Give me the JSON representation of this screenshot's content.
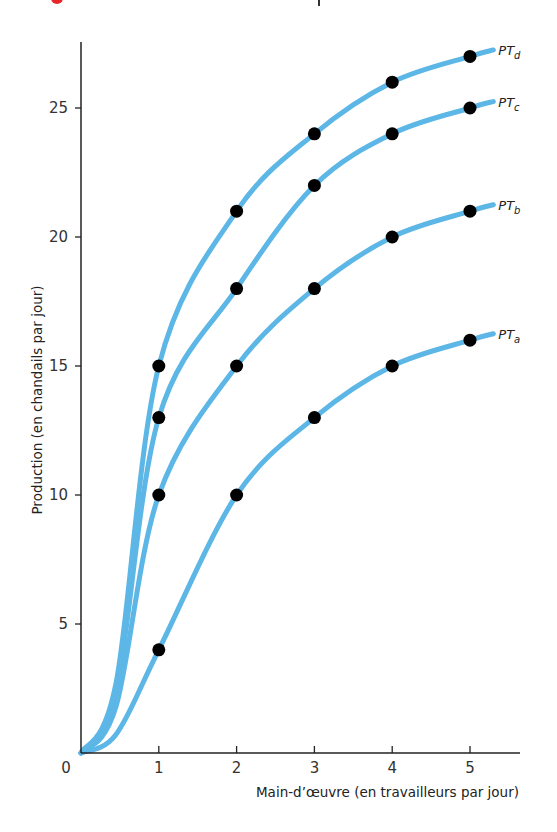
{
  "chart_data": {
    "type": "line",
    "title": "",
    "xlabel": "Main-d’œuvre (en travailleurs par jour)",
    "ylabel": "Production (en chandails par jour)",
    "x": [
      1,
      2,
      3,
      4,
      5
    ],
    "x_ticks": [
      "0",
      "1",
      "2",
      "3",
      "4",
      "5"
    ],
    "y_ticks": [
      "5",
      "10",
      "15",
      "20",
      "25"
    ],
    "xlim": [
      0,
      5.6
    ],
    "ylim": [
      0,
      28
    ],
    "grid": false,
    "legend_position": "inline-right",
    "series": [
      {
        "name": "PTa",
        "label_main": "PT",
        "label_sub": "a",
        "values": [
          4,
          10,
          13,
          15,
          16
        ]
      },
      {
        "name": "PTb",
        "label_main": "PT",
        "label_sub": "b",
        "values": [
          10,
          15,
          18,
          20,
          21
        ]
      },
      {
        "name": "PTc",
        "label_main": "PT",
        "label_sub": "c",
        "values": [
          13,
          18,
          22,
          24,
          25
        ]
      },
      {
        "name": "PTd",
        "label_main": "PT",
        "label_sub": "d",
        "values": [
          15,
          21,
          24,
          26,
          27
        ]
      }
    ],
    "colors": {
      "curve": "#5cb6e6",
      "point": "#000000",
      "axis": "#222222",
      "accent_fragment": "#e8262a"
    }
  }
}
